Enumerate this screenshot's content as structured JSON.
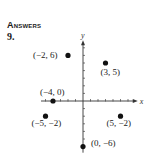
{
  "header": {
    "title": "Answers",
    "problem_number": "9."
  },
  "chart_data": {
    "type": "scatter",
    "title": "",
    "xlabel": "x",
    "ylabel": "y",
    "xlim": [
      -6,
      6
    ],
    "ylim": [
      -7,
      8
    ],
    "grid": false,
    "points": [
      {
        "x": -2,
        "y": 6,
        "label": "(−2, 6)"
      },
      {
        "x": 3,
        "y": 5,
        "label": "(3, 5)"
      },
      {
        "x": -4,
        "y": 0,
        "label": "(−4, 0)"
      },
      {
        "x": -5,
        "y": -2,
        "label": "(−5, −2)"
      },
      {
        "x": 5,
        "y": -2,
        "label": "(5, −2)"
      },
      {
        "x": 0,
        "y": -6,
        "label": "(0, −6)"
      }
    ]
  }
}
